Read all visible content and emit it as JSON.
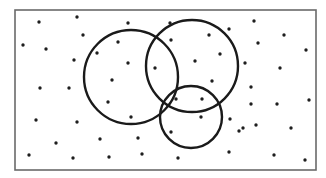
{
  "diagram": {
    "type": "venn-diagram",
    "canvas": {
      "width": 326,
      "height": 178,
      "background": "#ffffff"
    },
    "universe": {
      "x": 15,
      "y": 10,
      "width": 301,
      "height": 160,
      "stroke": "#6a6a6a"
    },
    "sets": [
      {
        "id": "A",
        "label": "",
        "cx": 131,
        "cy": 77,
        "r": 47,
        "stroke": "#1a1a1a"
      },
      {
        "id": "B",
        "label": "",
        "cx": 192,
        "cy": 66,
        "r": 46,
        "stroke": "#1a1a1a"
      },
      {
        "id": "C",
        "label": "",
        "cx": 191,
        "cy": 117,
        "r": 31,
        "stroke": "#1a1a1a"
      }
    ],
    "point_color": "#1e1e1e",
    "point_radius": 1.7,
    "points": [
      [
        39,
        22
      ],
      [
        77,
        17
      ],
      [
        128,
        23
      ],
      [
        170,
        23
      ],
      [
        209,
        35
      ],
      [
        229,
        29
      ],
      [
        254,
        21
      ],
      [
        23,
        45
      ],
      [
        46,
        49
      ],
      [
        83,
        35
      ],
      [
        118,
        42
      ],
      [
        171,
        40
      ],
      [
        258,
        43
      ],
      [
        284,
        35
      ],
      [
        306,
        50
      ],
      [
        97,
        53
      ],
      [
        74,
        60
      ],
      [
        128,
        63
      ],
      [
        195,
        61
      ],
      [
        220,
        54
      ],
      [
        245,
        63
      ],
      [
        280,
        68
      ],
      [
        112,
        80
      ],
      [
        40,
        88
      ],
      [
        69,
        88
      ],
      [
        155,
        68
      ],
      [
        212,
        81
      ],
      [
        251,
        87
      ],
      [
        108,
        102
      ],
      [
        176,
        99
      ],
      [
        202,
        99
      ],
      [
        251,
        104
      ],
      [
        277,
        104
      ],
      [
        309,
        100
      ],
      [
        36,
        120
      ],
      [
        77,
        122
      ],
      [
        131,
        117
      ],
      [
        201,
        117
      ],
      [
        230,
        119
      ],
      [
        243,
        128
      ],
      [
        171,
        132
      ],
      [
        256,
        125
      ],
      [
        291,
        128
      ],
      [
        239,
        131
      ],
      [
        56,
        143
      ],
      [
        100,
        139
      ],
      [
        138,
        138
      ],
      [
        29,
        155
      ],
      [
        73,
        158
      ],
      [
        109,
        157
      ],
      [
        142,
        154
      ],
      [
        178,
        158
      ],
      [
        229,
        152
      ],
      [
        274,
        155
      ],
      [
        305,
        160
      ]
    ]
  }
}
